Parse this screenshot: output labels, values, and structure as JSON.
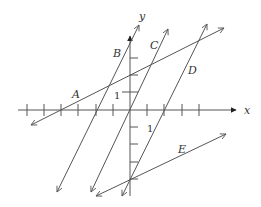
{
  "diagram": {
    "type": "coordinate-plane",
    "axes": {
      "x_label": "x",
      "y_label": "y",
      "x_unit_label": "1",
      "y_unit_label": "1",
      "x_ticks": [
        -6,
        -5,
        -4,
        -3,
        -2,
        -1,
        1,
        2,
        3,
        4
      ],
      "y_ticks": [
        3,
        2,
        1,
        -1,
        -2,
        -3,
        -4
      ]
    },
    "lines": [
      {
        "label": "A",
        "description": "shallow positive slope, crosses x-axis at -4 and y-axis at 2"
      },
      {
        "label": "B",
        "description": "steep positive slope, crosses x-axis at -2"
      },
      {
        "label": "C",
        "description": "steep positive slope, passes through origin"
      },
      {
        "label": "D",
        "description": "steep positive slope, crosses x-axis at 2 and y-axis at -4"
      },
      {
        "label": "E",
        "description": "shallow positive slope, passes through (0,-4)"
      }
    ],
    "colors": {
      "stroke": "#555555",
      "text": "#333333"
    }
  }
}
